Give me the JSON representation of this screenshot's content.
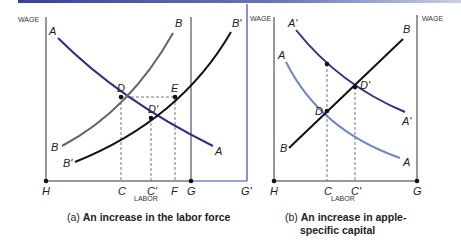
{
  "panel_a": {
    "y_axis_label": "WAGE",
    "x_axis_label": "LABOR",
    "caption_prefix": "(a)",
    "caption_text": "An increase in the labor force",
    "curve_labels": {
      "A_top": "A",
      "A_bottom": "A",
      "B_top": "B",
      "B_bottom": "B",
      "Bp_top": "B'",
      "Bp_bottom": "B'"
    },
    "point_labels": {
      "D": "D",
      "E": "E",
      "Dp": "D'"
    },
    "x_ticks": {
      "H": "H",
      "C": "C",
      "Cp": "C'",
      "F": "F",
      "G": "G",
      "Gp": "G'"
    }
  },
  "panel_b": {
    "y_axis_label_left": "WAGE",
    "y_axis_label_right": "WAGE",
    "x_axis_label": "LABOR",
    "caption_prefix": "(b)",
    "caption_line1": "An increase in apple-",
    "caption_line2": "specific capital",
    "curve_labels": {
      "Ap_top": "A'",
      "Ap_bottom": "A'",
      "A_top": "A",
      "A_bottom": "A",
      "B_top": "B",
      "B_bottom": "B"
    },
    "point_labels": {
      "D": "D",
      "Dp": "D'"
    },
    "x_ticks": {
      "H": "H",
      "C": "C",
      "Cp": "C'",
      "G": "G"
    }
  },
  "colors": {
    "demand_blue": "#2b2f8a",
    "demand_light_blue": "#6f86c6",
    "supply_black": "#111111",
    "supply_grey": "#666666",
    "axis": "#333333",
    "g_prime_axis": "#3a48b0"
  }
}
